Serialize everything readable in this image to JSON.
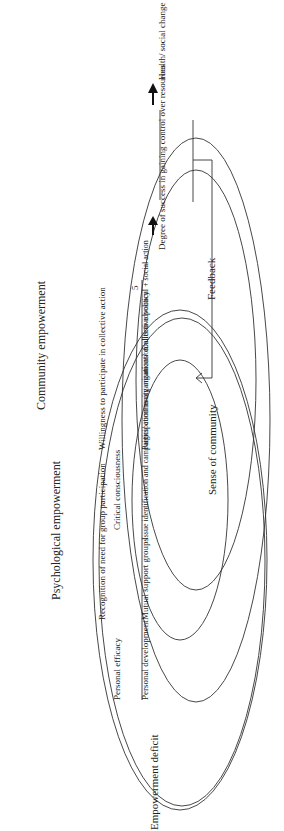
{
  "diagram": {
    "stages": [
      {
        "top": "Personal efficacy",
        "number": "1",
        "bottom": "Personal development"
      },
      {
        "top": "Recognition of need for group participation",
        "number": "2",
        "bottom": "Mutual support groups"
      },
      {
        "top": "Critical consciousness",
        "number": "3",
        "bottom": "Issue identification and campaigns/ community organization"
      },
      {
        "top": "Willingness to participate in collective action",
        "number": "4",
        "bottom": "Participation in organizations/ coalition advocacy"
      },
      {
        "top": "",
        "number": "5",
        "bottom": "Collective political + social action"
      }
    ],
    "labels": {
      "start": "Empowerment deficit",
      "psych": "Psychological empowerment",
      "community": "Community empowerment",
      "sense": "Sense of community",
      "feedback": "Feedback",
      "success": "Degree of success in gaining control over resources",
      "outcome": "Health/ social change"
    }
  }
}
